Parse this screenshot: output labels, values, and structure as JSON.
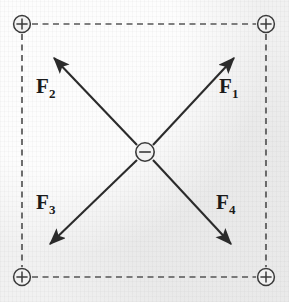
{
  "figure": {
    "background_color": "#f1f1f1",
    "ink_color": "#2b2b2b",
    "width": 289,
    "height": 302
  },
  "charges": {
    "corner_symbol": "+",
    "center_symbol": "−",
    "corners": [
      {
        "name": "charge-top-left",
        "label": "+",
        "x": 22,
        "y": 24,
        "radius": 8.5
      },
      {
        "name": "charge-top-right",
        "label": "+",
        "x": 266,
        "y": 24,
        "radius": 8.5
      },
      {
        "name": "charge-bottom-left",
        "label": "+",
        "x": 22,
        "y": 277,
        "radius": 8.5
      },
      {
        "name": "charge-bottom-right",
        "label": "+",
        "x": 266,
        "y": 277,
        "radius": 8.5
      }
    ],
    "center": {
      "name": "charge-center",
      "label": "−",
      "x": 145,
      "y": 152,
      "radius": 9.5
    }
  },
  "square": {
    "style": "dashed",
    "dash_length": 6,
    "gap_length": 4,
    "stroke_width": 1.6,
    "color": "#555555",
    "edges": [
      {
        "name": "edge-top",
        "x1": 32,
        "y1": 24,
        "x2": 256,
        "y2": 24
      },
      {
        "name": "edge-bottom",
        "x1": 32,
        "y1": 277,
        "x2": 256,
        "y2": 277
      },
      {
        "name": "edge-left",
        "x1": 22,
        "y1": 34,
        "x2": 22,
        "y2": 267
      },
      {
        "name": "edge-right",
        "x1": 266,
        "y1": 34,
        "x2": 266,
        "y2": 267
      }
    ]
  },
  "vectors": [
    {
      "name": "force-vector-f1",
      "label": "F",
      "subscript": "1",
      "from_x": 153,
      "from_y": 145,
      "to_x": 236,
      "to_y": 56,
      "direction": "up-right",
      "points_toward": "charge-top-right",
      "label_x": 219,
      "label_y": 82
    },
    {
      "name": "force-vector-f2",
      "label": "F",
      "subscript": "2",
      "from_x": 137,
      "from_y": 145,
      "to_x": 52,
      "to_y": 56,
      "direction": "up-left",
      "points_toward": "charge-top-left",
      "label_x": 37,
      "label_y": 82
    },
    {
      "name": "force-vector-f3",
      "label": "F",
      "subscript": "3",
      "from_x": 137,
      "from_y": 160,
      "to_x": 48,
      "to_y": 246,
      "direction": "down-left",
      "points_toward": "charge-bottom-left",
      "label_x": 37,
      "label_y": 198
    },
    {
      "name": "force-vector-f4",
      "label": "F",
      "subscript": "4",
      "from_x": 153,
      "from_y": 160,
      "to_x": 233,
      "to_y": 246,
      "direction": "down-right",
      "points_toward": "charge-bottom-right",
      "label_x": 217,
      "label_y": 198
    }
  ]
}
